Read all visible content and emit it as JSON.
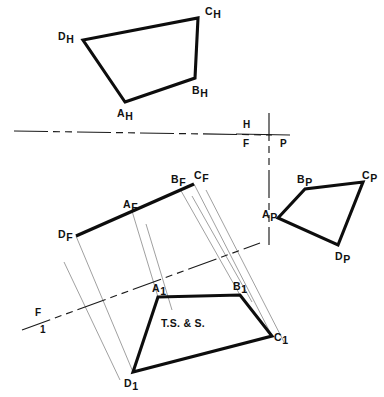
{
  "drawing": {
    "title": "Auxiliary view of an oblique plane ABCD",
    "background_color": "#ffffff",
    "line_color": "#0d0d0d",
    "construction_line_color": "#8f8f8f",
    "width": 384,
    "height": 397,
    "annotation": "T.S. & S."
  },
  "fold_lines": {
    "hf": {
      "name": "H/F reference line",
      "upper_label": "H",
      "lower_label": "F",
      "x1": 14,
      "y1": 131,
      "x2": 272,
      "y2": 135,
      "label_upper_x": 243,
      "label_upper_y": 128,
      "label_lower_x": 243,
      "label_lower_y": 147
    },
    "fp": {
      "name": "F/P reference line",
      "left_label": "F",
      "right_label": "P",
      "x1": 269,
      "y1": 113,
      "x2": 269,
      "y2": 245,
      "label_left_x": 243,
      "label_left_y": 147,
      "label_right_x": 280,
      "label_right_y": 147
    },
    "f1": {
      "name": "F/1 reference line",
      "upper_label": "F",
      "lower_label": "1",
      "x1": 22,
      "y1": 330,
      "x2": 260,
      "y2": 243,
      "label_upper_x": 35,
      "label_upper_y": 316,
      "label_lower_x": 40,
      "label_lower_y": 333
    }
  },
  "views": [
    {
      "id": "top",
      "name": "horizontal-top-view",
      "plane": "H",
      "label_suffix": "H",
      "points": [
        {
          "id": "A",
          "label": "A",
          "sub": "H",
          "x": 125,
          "y": 102,
          "label_x": 117,
          "label_y": 117
        },
        {
          "id": "B",
          "label": "B",
          "sub": "H",
          "x": 195,
          "y": 78,
          "label_x": 192,
          "label_y": 94
        },
        {
          "id": "C",
          "label": "C",
          "sub": "H",
          "x": 198,
          "y": 18,
          "label_x": 205,
          "label_y": 15
        },
        {
          "id": "D",
          "label": "D",
          "sub": "H",
          "x": 83,
          "y": 40,
          "label_x": 58,
          "label_y": 40
        }
      ]
    },
    {
      "id": "front",
      "name": "frontal-view-edge-view",
      "plane": "F",
      "label_suffix": "F",
      "edge_view": true,
      "points": [
        {
          "id": "D",
          "label": "D",
          "sub": "F",
          "x": 76,
          "y": 236,
          "label_x": 58,
          "label_y": 238
        },
        {
          "id": "A",
          "label": "A",
          "sub": "F",
          "x": 132,
          "y": 211,
          "label_x": 123,
          "label_y": 208
        },
        {
          "id": "B",
          "label": "B",
          "sub": "F",
          "x": 180,
          "y": 189,
          "label_x": 171,
          "label_y": 183
        },
        {
          "id": "C",
          "label": "C",
          "sub": "F",
          "x": 194,
          "y": 184,
          "label_x": 194,
          "label_y": 179
        }
      ]
    },
    {
      "id": "profile",
      "name": "profile-view",
      "plane": "P",
      "label_suffix": "P",
      "points": [
        {
          "id": "A",
          "label": "A",
          "sub": "P",
          "x": 278,
          "y": 218,
          "label_x": 262,
          "label_y": 218
        },
        {
          "id": "B",
          "label": "B",
          "sub": "P",
          "x": 305,
          "y": 189,
          "label_x": 297,
          "label_y": 183
        },
        {
          "id": "C",
          "label": "C",
          "sub": "P",
          "x": 363,
          "y": 182,
          "label_x": 362,
          "label_y": 179
        },
        {
          "id": "D",
          "label": "D",
          "sub": "P",
          "x": 338,
          "y": 245,
          "label_x": 335,
          "label_y": 260
        }
      ]
    },
    {
      "id": "auxiliary",
      "name": "auxiliary-view-1-true-size",
      "plane": "1",
      "label_suffix": "1",
      "note": "T.S. & S.",
      "note_x": 183,
      "note_y": 327,
      "points": [
        {
          "id": "A",
          "label": "A",
          "sub": "1",
          "x": 158,
          "y": 297,
          "label_x": 152,
          "label_y": 292
        },
        {
          "id": "B",
          "label": "B",
          "sub": "1",
          "x": 240,
          "y": 295,
          "label_x": 233,
          "label_y": 290
        },
        {
          "id": "C",
          "label": "C",
          "sub": "1",
          "x": 272,
          "y": 336,
          "label_x": 274,
          "label_y": 341
        },
        {
          "id": "D",
          "label": "D",
          "sub": "1",
          "x": 133,
          "y": 372,
          "label_x": 124,
          "label_y": 387
        }
      ]
    }
  ],
  "projection_lines": [
    {
      "name": "proj-D-F-to-1",
      "x1": 76,
      "y1": 236,
      "x2": 133,
      "y2": 372
    },
    {
      "name": "proj-A-F-to-1",
      "x1": 132,
      "y1": 211,
      "x2": 158,
      "y2": 297
    },
    {
      "name": "proj-B-F-to-1",
      "x1": 180,
      "y1": 189,
      "x2": 240,
      "y2": 295
    },
    {
      "name": "proj-C-F-to-1",
      "x1": 194,
      "y1": 184,
      "x2": 272,
      "y2": 336
    },
    {
      "name": "proj-D-extra",
      "x1": 64,
      "y1": 262,
      "x2": 120,
      "y2": 380
    },
    {
      "name": "proj-A-extra",
      "x1": 146,
      "y1": 224,
      "x2": 172,
      "y2": 310
    },
    {
      "name": "proj-B-extra",
      "x1": 192,
      "y1": 196,
      "x2": 252,
      "y2": 302
    },
    {
      "name": "proj-C-extra",
      "x1": 206,
      "y1": 190,
      "x2": 284,
      "y2": 342
    }
  ]
}
